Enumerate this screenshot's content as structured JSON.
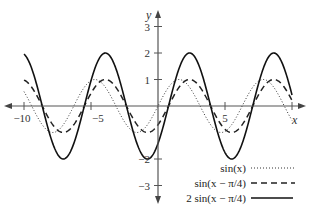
{
  "chart_data": {
    "type": "line",
    "title": "",
    "xlabel": "x",
    "ylabel": "y",
    "xlim": [
      -10,
      10
    ],
    "ylim": [
      -3,
      3
    ],
    "grid": false,
    "legend_position": "lower right",
    "x_ticks": [
      -10,
      -5,
      5,
      10
    ],
    "x_tick_labels": [
      "−10",
      "−5",
      "5",
      ""
    ],
    "y_ticks": [
      3,
      2,
      1,
      -2,
      -3
    ],
    "y_tick_labels": [
      "3",
      "2",
      "1",
      "−2",
      "−3"
    ],
    "series": [
      {
        "name": "sin(x)",
        "expr": "sin(x)",
        "amplitude": 1,
        "shift": 0,
        "style": "dotted",
        "color": "#333333"
      },
      {
        "name": "sin(x − π/4)",
        "expr": "sin(x - pi/4)",
        "amplitude": 1,
        "shift": 0.7854,
        "style": "dashed",
        "color": "#222222"
      },
      {
        "name": "2 sin(x − π/4)",
        "expr": "2*sin(x - pi/4)",
        "amplitude": 2,
        "shift": 0.7854,
        "style": "solid",
        "color": "#111111"
      }
    ],
    "x_domain": [
      -10,
      10
    ]
  },
  "axes": {
    "x_label": "x",
    "y_label": "y"
  },
  "legend": [
    {
      "label": "sin(x)"
    },
    {
      "label": "sin(x − π/4)"
    },
    {
      "label": "2 sin(x − π/4)"
    }
  ]
}
